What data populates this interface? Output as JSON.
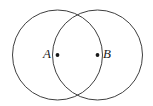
{
  "figure": {
    "name": "two-intersecting-circles",
    "background_color": "#ffffff",
    "width": 153,
    "height": 106,
    "stroke_color": "#3f3f3f",
    "stroke_width": 1,
    "dot_color": "#1a1a1a",
    "label_color": "#1a1a1a",
    "label_font_size": 13
  },
  "circles": [
    {
      "id": "circle-a",
      "label": "A",
      "center_x": 57.5,
      "center_y": 55,
      "radius": 45
    },
    {
      "id": "circle-b",
      "label": "B",
      "center_x": 97.5,
      "center_y": 55,
      "radius": 45
    }
  ],
  "points": [
    {
      "id": "point-a",
      "label": "A",
      "x": 57.5,
      "y": 55,
      "dot_radius": 1.9,
      "label_x": 51,
      "label_y": 55,
      "label_side": "left"
    },
    {
      "id": "point-b",
      "label": "B",
      "x": 97.5,
      "y": 55,
      "dot_radius": 1.9,
      "label_x": 103,
      "label_y": 55,
      "label_side": "right"
    }
  ],
  "chart_data": {
    "type": "diagram",
    "subtype": "venn-two-circles-vesica",
    "title": "",
    "xlabel": "",
    "ylabel": "",
    "categories": [
      "A",
      "B"
    ],
    "values": [
      45,
      45
    ],
    "annotations": [
      "A",
      "B"
    ],
    "center_distance": 40,
    "intersection_points": [
      {
        "x": 77.5,
        "y": 14.6
      },
      {
        "x": 77.5,
        "y": 95.4
      }
    ],
    "legend": [],
    "grid": false
  }
}
